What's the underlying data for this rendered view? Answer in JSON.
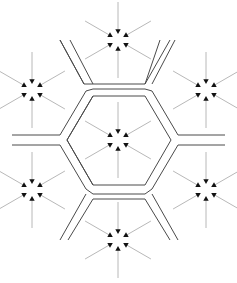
{
  "diagram": {
    "type": "hexagonal-tessellation",
    "colors": {
      "background": "#ffffff",
      "wall": "#4a4a4a",
      "arrow_shaft": "#b8b8b8",
      "arrow_head": "#111111"
    },
    "cells": [
      {
        "id": "center",
        "cx": 118,
        "cy": 140
      },
      {
        "id": "top",
        "cx": 118,
        "cy": 40
      },
      {
        "id": "upper-left",
        "cx": 32,
        "cy": 90
      },
      {
        "id": "upper-right",
        "cx": 206,
        "cy": 90
      },
      {
        "id": "lower-left",
        "cx": 32,
        "cy": 190
      },
      {
        "id": "lower-right",
        "cx": 206,
        "cy": 190
      },
      {
        "id": "bottom",
        "cx": 118,
        "cy": 240
      }
    ],
    "arrows_per_cell": 6,
    "arrow": {
      "outer_radius": 38,
      "inner_radius": 6,
      "head_size": 3
    },
    "inner_hexagon": [
      [
        67,
        140
      ],
      [
        93,
        96
      ],
      [
        145,
        96
      ],
      [
        171,
        140
      ],
      [
        145,
        185
      ],
      [
        93,
        185
      ]
    ],
    "walls": [
      [
        [
          60,
          40
        ],
        [
          85,
          85
        ],
        [
          150,
          85
        ],
        [
          175,
          40
        ]
      ],
      [
        [
          93,
          96
        ],
        [
          145,
          96
        ],
        [
          171,
          140
        ],
        [
          145,
          185
        ],
        [
          93,
          185
        ],
        [
          67,
          140
        ],
        [
          93,
          96
        ]
      ],
      [
        [
          12,
          135
        ],
        [
          58,
          135
        ],
        [
          84,
          91
        ]
      ],
      [
        [
          12,
          145
        ],
        [
          58,
          145
        ],
        [
          84,
          189
        ]
      ],
      [
        [
          225,
          135
        ],
        [
          180,
          135
        ],
        [
          154,
          91
        ]
      ],
      [
        [
          225,
          145
        ],
        [
          180,
          145
        ],
        [
          154,
          189
        ]
      ],
      [
        [
          60,
          240
        ],
        [
          85,
          195
        ],
        [
          150,
          195
        ],
        [
          175,
          240
        ]
      ],
      [
        [
          58,
          135
        ],
        [
          84,
          91
        ]
      ],
      [
        [
          154,
          91
        ],
        [
          180,
          135
        ]
      ]
    ]
  }
}
